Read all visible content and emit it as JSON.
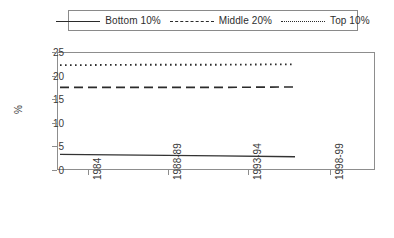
{
  "chart_data": {
    "type": "line",
    "title": "",
    "xlabel": "",
    "ylabel": "%",
    "categories": [
      "1984",
      "1988-89",
      "1993-94",
      "1998-99"
    ],
    "ylim": [
      0,
      25
    ],
    "yticks": [
      0,
      5,
      10,
      15,
      20,
      25
    ],
    "grid": false,
    "legend_position": "top",
    "series": [
      {
        "name": "Bottom 10%",
        "style": "solid",
        "values": [
          3.3,
          3.15,
          3.0,
          2.8
        ]
      },
      {
        "name": "Middle 20%",
        "style": "dashed",
        "values": [
          17.5,
          17.5,
          17.5,
          17.6
        ]
      },
      {
        "name": "Top 10%",
        "style": "dotted",
        "values": [
          22.2,
          22.3,
          22.3,
          22.4
        ]
      }
    ]
  },
  "legend": {
    "items": [
      {
        "label": "Bottom 10%",
        "style": "solid"
      },
      {
        "label": "Middle 20%",
        "style": "dashed"
      },
      {
        "label": "Top 10%",
        "style": "dotted"
      }
    ]
  },
  "axes": {
    "y": {
      "title": "%",
      "ticks": [
        "0",
        "5",
        "10",
        "15",
        "20",
        "25"
      ]
    },
    "x": {
      "ticks": [
        "1984",
        "1988-89",
        "1993-94",
        "1998-99"
      ]
    }
  },
  "colors": {
    "line": "#2b2b2b",
    "frame": "#8d8d8d",
    "text": "#3a3a3a",
    "background": "#ffffff"
  }
}
